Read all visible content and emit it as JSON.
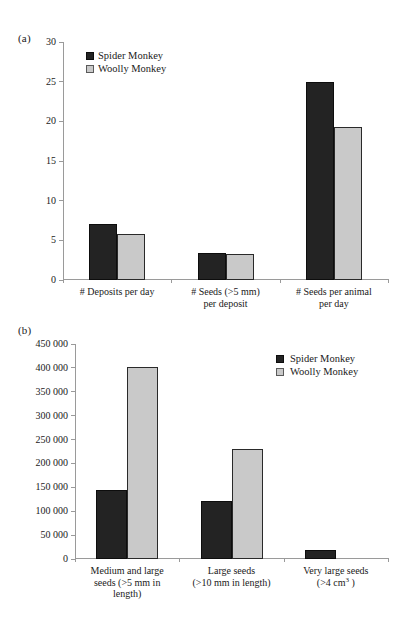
{
  "figure": {
    "panel_a_letter": "(a)",
    "panel_b_letter": "(b)"
  },
  "colors": {
    "spider_monkey": "#232323",
    "woolly_monkey": "#c9c9c9",
    "axis": "#9a9a9a",
    "text": "#1a1a1a",
    "background": "#ffffff"
  },
  "legend": {
    "spider_monkey": "Spider Monkey",
    "woolly_monkey": "Woolly Monkey"
  },
  "chart_data": [
    {
      "type": "bar",
      "panel": "(a)",
      "title": "",
      "xlabel": "",
      "ylabel": "",
      "ylim": [
        0,
        30
      ],
      "ytick_step": 5,
      "grid": false,
      "legend_position": "top-left",
      "ytick_labels": [
        "0",
        "5",
        "10",
        "15",
        "20",
        "25",
        "30"
      ],
      "ytick_values": [
        0,
        5,
        10,
        15,
        20,
        25,
        30
      ],
      "categories": [
        "# Deposits per day",
        "# Seeds (>5 mm) per deposit",
        "# Seeds per animal per day"
      ],
      "category_lines": [
        [
          "# Deposits per day"
        ],
        [
          "# Seeds (>5 mm)",
          "per deposit"
        ],
        [
          "# Seeds per animal",
          "per day"
        ]
      ],
      "series": [
        {
          "name": "Spider Monkey",
          "color": "#232323",
          "values": [
            7.0,
            3.4,
            25.0
          ]
        },
        {
          "name": "Woolly Monkey",
          "color": "#c9c9c9",
          "values": [
            5.8,
            3.3,
            19.3
          ]
        }
      ]
    },
    {
      "type": "bar",
      "panel": "(b)",
      "title": "",
      "xlabel": "",
      "ylabel": "",
      "ylim": [
        0,
        450000
      ],
      "ytick_step": 50000,
      "grid": false,
      "legend_position": "top-right",
      "ytick_labels": [
        "0",
        "50 000",
        "100 000",
        "150 000",
        "200 000",
        "250 000",
        "300 000",
        "350 000",
        "400 000",
        "450 000"
      ],
      "ytick_values": [
        0,
        50000,
        100000,
        150000,
        200000,
        250000,
        300000,
        350000,
        400000,
        450000
      ],
      "categories": [
        "Medium and large seeds (>5 mm in length)",
        "Large seeds (>10 mm in length)",
        "Very large seeds (>4 cm3)"
      ],
      "category_lines": [
        [
          "Medium and large",
          "seeds (>5 mm in",
          "length)"
        ],
        [
          "Large seeds",
          "(>10 mm in length)"
        ],
        [
          "Very large seeds",
          "(>4 cm³ )"
        ]
      ],
      "series": [
        {
          "name": "Spider Monkey",
          "color": "#232323",
          "values": [
            145000,
            121000,
            18000
          ]
        },
        {
          "name": "Woolly Monkey",
          "color": "#c9c9c9",
          "values": [
            402000,
            230000,
            0
          ]
        }
      ]
    }
  ]
}
